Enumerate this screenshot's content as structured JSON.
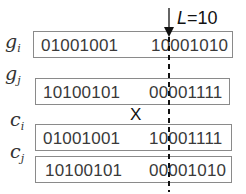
{
  "diagram": {
    "cut_label_var": "L",
    "cut_label_eq": "=10",
    "crossover_symbol": "X",
    "rows": [
      {
        "label_base": "g",
        "label_sub": "i",
        "left_bits": "01001001",
        "right_bits": "10001010"
      },
      {
        "label_base": "g",
        "label_sub": "j",
        "left_bits": "10100101",
        "right_bits": "00001111"
      },
      {
        "label_base": "c",
        "label_sub": "i",
        "left_bits": "01001001",
        "right_bits": "10001111"
      },
      {
        "label_base": "c",
        "label_sub": "j",
        "left_bits": "10100101",
        "right_bits": "00001010"
      }
    ],
    "colors": {
      "box_border": "#8a8a8a",
      "text": "#3a3a3a",
      "cut_line": "#111111"
    }
  }
}
